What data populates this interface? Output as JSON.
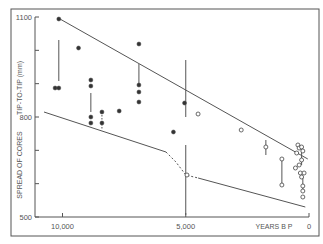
{
  "chart_data": {
    "type": "scatter",
    "title": "",
    "xlabel": "YEARS B P",
    "ylabel_upper": "TIP-TO-TIP (mm)",
    "ylabel_lower": "SPREAD OF CORES",
    "xlim": [
      11000,
      0
    ],
    "ylim": [
      500,
      1100
    ],
    "x_ticks": [
      {
        "value": 10000,
        "label": "10,000"
      },
      {
        "value": 5000,
        "label": "5,000"
      },
      {
        "value": 0,
        "label": "0"
      }
    ],
    "y_ticks": [
      {
        "value": 1100,
        "label": "1100"
      },
      {
        "value": 1000,
        "label": ""
      },
      {
        "value": 900,
        "label": ""
      },
      {
        "value": 800,
        "label": "800"
      },
      {
        "value": 700,
        "label": ""
      },
      {
        "value": 600,
        "label": ""
      },
      {
        "value": 500,
        "label": "500"
      }
    ],
    "grid": false,
    "series": [
      {
        "name": "filled",
        "marker": "filled-circle",
        "points": [
          [
            10150,
            1094
          ],
          [
            10300,
            887
          ],
          [
            10150,
            887
          ],
          [
            9350,
            1007
          ],
          [
            8850,
            911
          ],
          [
            8850,
            893
          ],
          [
            8850,
            800
          ],
          [
            8850,
            782
          ],
          [
            8400,
            815
          ],
          [
            8400,
            782
          ],
          [
            7700,
            818
          ],
          [
            6900,
            1019
          ],
          [
            6900,
            896
          ],
          [
            6900,
            875
          ],
          [
            6900,
            845
          ],
          [
            5500,
            755
          ],
          [
            5050,
            842
          ]
        ]
      },
      {
        "name": "open",
        "marker": "open-circle",
        "points": [
          [
            4500,
            809
          ],
          [
            2750,
            761
          ],
          [
            4950,
            626
          ],
          [
            1750,
            710
          ],
          [
            1100,
            674
          ],
          [
            1100,
            596
          ],
          [
            450,
            716
          ],
          [
            400,
            707
          ],
          [
            300,
            710
          ],
          [
            250,
            698
          ],
          [
            500,
            692
          ],
          [
            300,
            671
          ],
          [
            400,
            656
          ],
          [
            550,
            647
          ],
          [
            350,
            632
          ],
          [
            200,
            632
          ],
          [
            300,
            620
          ],
          [
            250,
            593
          ],
          [
            250,
            578
          ],
          [
            250,
            560
          ]
        ]
      }
    ],
    "range_bars": [
      {
        "x": 10150,
        "y_from": 1031,
        "y_to": 908,
        "style": "solid"
      },
      {
        "x": 8850,
        "y_from": 872,
        "y_to": 815,
        "style": "solid"
      },
      {
        "x": 8400,
        "y_from": 815,
        "y_to": 761,
        "style": "dashed"
      },
      {
        "x": 6900,
        "y_from": 959,
        "y_to": 896,
        "style": "solid"
      },
      {
        "x": 5000,
        "y_from": 971,
        "y_to": 800,
        "style": "solid"
      },
      {
        "x": 5000,
        "y_from": 716,
        "y_to": 506,
        "style": "solid"
      },
      {
        "x": 1750,
        "y_from": 731,
        "y_to": 686,
        "style": "solid"
      },
      {
        "x": 1100,
        "y_from": 674,
        "y_to": 596,
        "style": "solid"
      },
      {
        "x": 300,
        "y_from": 707,
        "y_to": 656,
        "style": "solid"
      },
      {
        "x": 250,
        "y_from": 620,
        "y_to": 578,
        "style": "solid"
      }
    ],
    "envelope_lines": [
      {
        "name": "upper",
        "style": "solid",
        "points": [
          [
            10100,
            1094
          ],
          [
            50,
            674
          ]
        ]
      },
      {
        "name": "lower-left",
        "style": "solid",
        "points": [
          [
            10750,
            815
          ],
          [
            5800,
            695
          ]
        ]
      },
      {
        "name": "lower-mid",
        "style": "dashed",
        "points": [
          [
            5800,
            695
          ],
          [
            5400,
            665
          ],
          [
            5000,
            626
          ],
          [
            4500,
            617
          ]
        ]
      },
      {
        "name": "lower-right",
        "style": "solid",
        "points": [
          [
            4500,
            617
          ],
          [
            150,
            530
          ]
        ]
      }
    ]
  }
}
